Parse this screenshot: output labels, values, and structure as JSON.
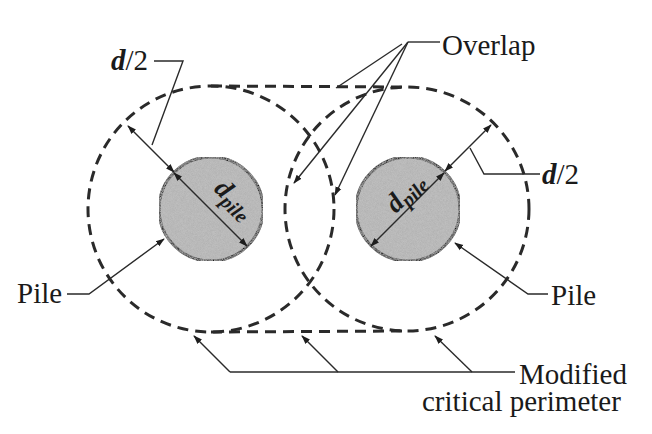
{
  "diagram": {
    "type": "pile-critical-perimeter",
    "colors": {
      "background": "#ffffff",
      "line": "#2a2a2a",
      "pile_fill": "#b3b3b3",
      "text": "#1a1a1a"
    },
    "labels": {
      "d_half_left": {
        "main": "d",
        "rest": "/2"
      },
      "d_half_right": {
        "main": "d",
        "rest": "/2"
      },
      "overlap": "Overlap",
      "pile_left": "Pile",
      "pile_right": "Pile",
      "perimeter_line1": "Modified",
      "perimeter_line2": "critical perimeter",
      "d_pile_left": {
        "main": "d",
        "sub": "pile"
      },
      "d_pile_right": {
        "main": "d",
        "sub": "pile"
      }
    },
    "geometry": {
      "pile_left": {
        "cx": 211,
        "cy": 209,
        "r": 52
      },
      "pile_right": {
        "cx": 408,
        "cy": 209,
        "r": 52
      },
      "perimeter_left": {
        "cx": 211,
        "cy": 209,
        "r": 123
      },
      "perimeter_right": {
        "cx": 407,
        "cy": 209,
        "r": 122
      }
    }
  }
}
